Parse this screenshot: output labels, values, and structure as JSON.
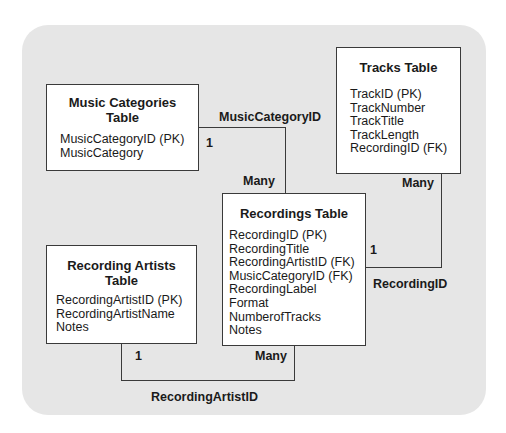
{
  "diagram": {
    "type": "entity-relationship",
    "tables": [
      {
        "id": "music_categories",
        "title_lines": [
          "Music Categories",
          "Table"
        ],
        "fields": [
          "MusicCategoryID (PK)",
          "MusicCategory"
        ]
      },
      {
        "id": "tracks",
        "title_lines": [
          "Tracks Table"
        ],
        "fields": [
          "TrackID (PK)",
          "TrackNumber",
          "TrackTitle",
          "TrackLength",
          "RecordingID (FK)"
        ]
      },
      {
        "id": "recordings",
        "title_lines": [
          "Recordings Table"
        ],
        "fields": [
          "RecordingID (PK)",
          "RecordingTitle",
          "RecordingArtistID (FK)",
          "MusicCategoryID (FK)",
          "RecordingLabel",
          "Format",
          "NumberofTracks",
          "Notes"
        ]
      },
      {
        "id": "recording_artists",
        "title_lines": [
          "Recording Artists",
          "Table"
        ],
        "fields": [
          "RecordingArtistID (PK)",
          "RecordingArtistName",
          "Notes"
        ]
      }
    ],
    "relationships": [
      {
        "key": "MusicCategoryID",
        "from": "music_categories",
        "from_cardinality": "1",
        "to": "recordings",
        "to_cardinality": "Many"
      },
      {
        "key": "RecordingID",
        "from": "recordings",
        "from_cardinality": "1",
        "to": "tracks",
        "to_cardinality": "Many"
      },
      {
        "key": "RecordingArtistID",
        "from": "recording_artists",
        "from_cardinality": "1",
        "to": "recordings",
        "to_cardinality": "Many"
      }
    ]
  },
  "colors": {
    "panel_background": "#e6e6e6",
    "box_background": "#ffffff",
    "line": "#3a3a3a",
    "text": "#1a1a1a"
  }
}
